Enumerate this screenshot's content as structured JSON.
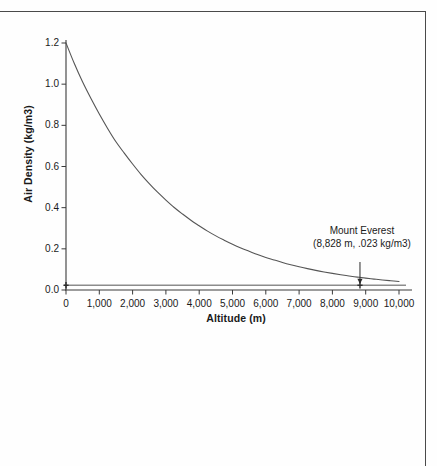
{
  "figure": {
    "background_color": "#fefefe",
    "frame_color": "#4a4a4a"
  },
  "chart_data": {
    "type": "line",
    "title": "",
    "xlabel": "Altitude (m)",
    "ylabel": "Air Density (kg/m3)",
    "xlim": [
      0,
      10000
    ],
    "ylim": [
      0,
      1.2
    ],
    "grid": false,
    "legend": "none",
    "line_color": "#555555",
    "xticks": [
      0,
      1000,
      2000,
      3000,
      4000,
      5000,
      6000,
      7000,
      8000,
      9000,
      10000
    ],
    "xtick_labels": [
      "0",
      "1,000",
      "2,000",
      "3,000",
      "4,000",
      "5,000",
      "6,000",
      "7,000",
      "8,000",
      "9,000",
      "10,000"
    ],
    "yticks": [
      0.0,
      0.2,
      0.4,
      0.6,
      0.8,
      1.0,
      1.2
    ],
    "ytick_labels": [
      "0.0",
      "0.2",
      "0.4",
      "0.6",
      "0.8",
      "1.0",
      "1.2"
    ],
    "x": [
      0,
      250,
      500,
      750,
      1000,
      1250,
      1500,
      1750,
      2000,
      2250,
      2500,
      2750,
      3000,
      3250,
      3500,
      3750,
      4000,
      4250,
      4500,
      4750,
      5000,
      5250,
      5500,
      5750,
      6000,
      6250,
      6500,
      6750,
      7000,
      7250,
      7500,
      7750,
      8000,
      8250,
      8500,
      8750,
      9000,
      9250,
      9500,
      9750,
      10000
    ],
    "y": [
      1.2,
      1.1,
      1.01,
      0.93,
      0.855,
      0.785,
      0.72,
      0.665,
      0.612,
      0.562,
      0.517,
      0.475,
      0.437,
      0.401,
      0.369,
      0.339,
      0.312,
      0.286,
      0.263,
      0.242,
      0.222,
      0.204,
      0.188,
      0.172,
      0.158,
      0.146,
      0.134,
      0.123,
      0.113,
      0.104,
      0.0955,
      0.0878,
      0.0807,
      0.0742,
      0.0682,
      0.0627,
      0.0577,
      0.053,
      0.0488,
      0.0448,
      0.0412
    ],
    "series_name": "Air density",
    "reference_line": {
      "label": "Mount Everest air density",
      "value": 0.023,
      "orientation": "horizontal",
      "color": "#8c8c8c"
    },
    "annotations": [
      {
        "name": "mount-everest",
        "line1": "Mount Everest",
        "line2": "(8,828 m, .023 kg/m3)",
        "x": 8828,
        "y": 0.023,
        "arrow": "down"
      }
    ],
    "markers": [
      {
        "x": 0,
        "y": 0.023
      },
      {
        "x": 8828,
        "y": 0.023
      }
    ]
  }
}
